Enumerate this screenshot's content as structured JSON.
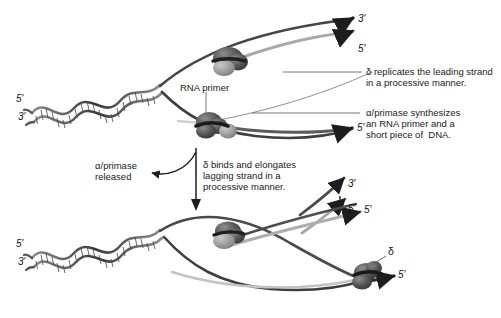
{
  "figure": {
    "background_color": "#ffffff",
    "width": 501,
    "height": 318
  },
  "colors": {
    "strand_dark": "#2b2b2b",
    "strand_mid": "#6e6e6e",
    "strand_light": "#b4b4b4",
    "protein_dark": "#4a4a4a",
    "protein_mid": "#7d7d7d",
    "protein_light": "#a8a8a8",
    "text": "#1a1a1a",
    "leader_line": "#555555"
  },
  "annotations": {
    "rna_primer": {
      "label": "RNA primer"
    },
    "delta_leading": {
      "line1": "δ replicates the leading strand",
      "line2": "in a processive manner."
    },
    "alpha_primase": {
      "line1": "α/primase synthesizes",
      "line2": "an RNA primer and a",
      "line3": "short piece of  DNA."
    },
    "alpha_released": {
      "line1": "α/primase",
      "line2": "released"
    },
    "delta_binds": {
      "line1": "δ binds and elongates",
      "line2": "lagging strand in a",
      "line3": "processive manner."
    },
    "delta_symbol": {
      "label": "δ"
    }
  },
  "strand_labels": {
    "top_helix_5prime": "5′",
    "top_helix_3prime": "3′",
    "top_right_3prime": "3′",
    "top_right_5prime": "5′",
    "mid_right_5prime": "5′",
    "mid_right_3prime": "3′",
    "mid_right_5prime_b": "5′",
    "bottom_helix_5prime": "5′",
    "bottom_helix_3prime": "3′",
    "bottom_right_5prime": "5′",
    "bottom_right_5prime_b": "5′"
  }
}
